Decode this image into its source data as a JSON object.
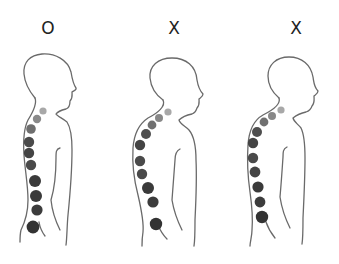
{
  "figures": [
    {
      "label": "O",
      "verdict": "correct-posture",
      "label_x": 48,
      "vertebrae": [
        {
          "x": 43,
          "y": 111,
          "r": 3.6,
          "color": "#a8a8a8"
        },
        {
          "x": 37,
          "y": 119,
          "r": 4.2,
          "color": "#8a8a8a"
        },
        {
          "x": 31,
          "y": 129,
          "r": 4.8,
          "color": "#6e6e6e"
        },
        {
          "x": 29,
          "y": 142,
          "r": 5.2,
          "color": "#4a4a4a"
        },
        {
          "x": 29,
          "y": 153,
          "r": 5.2,
          "color": "#444444"
        },
        {
          "x": 31,
          "y": 165,
          "r": 5.2,
          "color": "#4a4a4a"
        },
        {
          "x": 35,
          "y": 181,
          "r": 6.0,
          "color": "#3a3a3a"
        },
        {
          "x": 36,
          "y": 196,
          "r": 6.0,
          "color": "#3a3a3a"
        },
        {
          "x": 37,
          "y": 210,
          "r": 5.6,
          "color": "#3c3c3c"
        },
        {
          "x": 33,
          "y": 227,
          "r": 6.4,
          "color": "#333333"
        }
      ]
    },
    {
      "label": "X",
      "verdict": "incorrect-posture",
      "label_x": 174,
      "vertebrae": [
        {
          "x": 168,
          "y": 112,
          "r": 3.6,
          "color": "#a8a8a8"
        },
        {
          "x": 159,
          "y": 118,
          "r": 4.0,
          "color": "#888888"
        },
        {
          "x": 152,
          "y": 125,
          "r": 4.4,
          "color": "#707070"
        },
        {
          "x": 146,
          "y": 134,
          "r": 5.0,
          "color": "#4e4e4e"
        },
        {
          "x": 140,
          "y": 145,
          "r": 5.2,
          "color": "#444444"
        },
        {
          "x": 140,
          "y": 161,
          "r": 5.2,
          "color": "#4a4a4a"
        },
        {
          "x": 142,
          "y": 174,
          "r": 5.2,
          "color": "#4a4a4a"
        },
        {
          "x": 148,
          "y": 188,
          "r": 6.0,
          "color": "#3a3a3a"
        },
        {
          "x": 153,
          "y": 202,
          "r": 5.6,
          "color": "#3c3c3c"
        },
        {
          "x": 156,
          "y": 224,
          "r": 6.2,
          "color": "#333333"
        }
      ]
    },
    {
      "label": "X",
      "verdict": "incorrect-posture",
      "label_x": 296,
      "vertebrae": [
        {
          "x": 281,
          "y": 110,
          "r": 3.6,
          "color": "#a8a8a8"
        },
        {
          "x": 272,
          "y": 116,
          "r": 4.0,
          "color": "#888888"
        },
        {
          "x": 264,
          "y": 122,
          "r": 4.4,
          "color": "#707070"
        },
        {
          "x": 257,
          "y": 132,
          "r": 5.0,
          "color": "#4e4e4e"
        },
        {
          "x": 253,
          "y": 143,
          "r": 5.2,
          "color": "#444444"
        },
        {
          "x": 253,
          "y": 158,
          "r": 5.2,
          "color": "#4a4a4a"
        },
        {
          "x": 255,
          "y": 172,
          "r": 5.4,
          "color": "#444444"
        },
        {
          "x": 258,
          "y": 187,
          "r": 5.6,
          "color": "#3a3a3a"
        },
        {
          "x": 260,
          "y": 202,
          "r": 5.4,
          "color": "#3c3c3c"
        },
        {
          "x": 262,
          "y": 217,
          "r": 6.2,
          "color": "#333333"
        }
      ]
    }
  ],
  "colors": {
    "outline": "#6a6a6a",
    "label": "#222222",
    "background": "#ffffff"
  }
}
